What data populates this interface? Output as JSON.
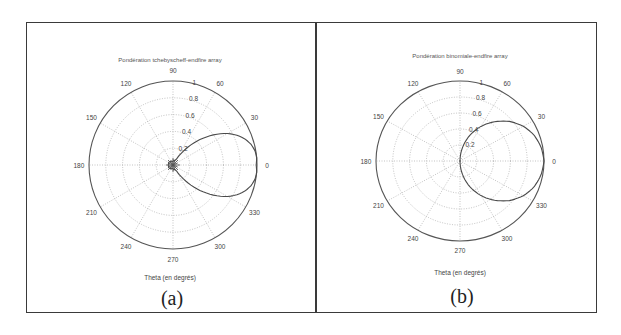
{
  "chart_data": [
    {
      "type": "line",
      "subtype": "polar",
      "panel_label": "(a)",
      "title": "Pondération tchebyscheff-endfire array",
      "xlabel": "Theta (en degrés)",
      "angle_ticks": [
        "0",
        "30",
        "60",
        "90",
        "120",
        "150",
        "180",
        "210",
        "240",
        "270",
        "300",
        "330"
      ],
      "radial_ticks": [
        "0.2",
        "0.4",
        "0.6",
        "0.8",
        "1"
      ],
      "rlim": [
        0,
        1
      ],
      "grid": true,
      "series": [
        {
          "name": "tchebyscheff-endfire",
          "theta_deg": [
            0,
            5,
            10,
            15,
            20,
            25,
            30,
            35,
            40,
            45,
            50,
            55,
            60,
            70,
            80,
            90,
            120,
            150,
            180,
            210,
            240,
            270,
            280,
            290,
            300,
            305,
            310,
            315,
            320,
            325,
            330,
            335,
            340,
            345,
            350,
            355
          ],
          "r": [
            0.99,
            1.0,
            0.99,
            0.96,
            0.91,
            0.84,
            0.75,
            0.64,
            0.52,
            0.4,
            0.28,
            0.17,
            0.08,
            0.05,
            0.06,
            0.04,
            0.05,
            0.06,
            0.05,
            0.06,
            0.05,
            0.04,
            0.06,
            0.05,
            0.08,
            0.17,
            0.28,
            0.4,
            0.52,
            0.64,
            0.75,
            0.84,
            0.91,
            0.96,
            0.99,
            1.0
          ]
        }
      ]
    },
    {
      "type": "line",
      "subtype": "polar",
      "panel_label": "(b)",
      "title": "Pondération binomiale-endfire array",
      "xlabel": "Theta (en degrés)",
      "angle_ticks": [
        "0",
        "30",
        "60",
        "90",
        "120",
        "150",
        "180",
        "210",
        "240",
        "270",
        "300",
        "330"
      ],
      "radial_ticks": [
        "0.2",
        "0.4",
        "0.6",
        "0.8",
        "1"
      ],
      "rlim": [
        0,
        1
      ],
      "grid": true,
      "series": [
        {
          "name": "binomiale-endfire",
          "theta_deg": [
            0,
            10,
            20,
            30,
            40,
            50,
            60,
            70,
            80,
            90,
            270,
            280,
            290,
            300,
            310,
            320,
            330,
            340,
            350
          ],
          "r": [
            1.0,
            0.98,
            0.94,
            0.87,
            0.77,
            0.64,
            0.5,
            0.34,
            0.17,
            0.0,
            0.0,
            0.17,
            0.34,
            0.5,
            0.64,
            0.77,
            0.87,
            0.94,
            0.98
          ]
        }
      ]
    }
  ],
  "panels": [
    {
      "title": "Pondération tchebyscheff-endfire array",
      "xlabel": "Theta (en degrés)",
      "caption": "(a)"
    },
    {
      "title": "Pondération binomiale-endfire array",
      "xlabel": "Theta (en degrés)",
      "caption": "(b)"
    }
  ]
}
